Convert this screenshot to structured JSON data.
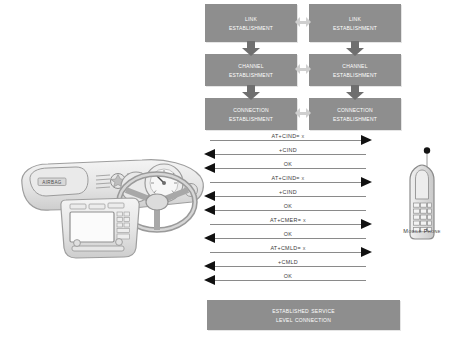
{
  "figure": {
    "background_color": "#ffffff",
    "box_fill": "#8e8e8e",
    "box_text_color": "#ffffff",
    "arrow_color": "#8a8a8a",
    "arrowhead_color": "#111111",
    "stack_arrow_color": "#6f6f6f",
    "interlink_arrow_color": "#cfcfcf"
  },
  "protocol_stack": {
    "left_column": [
      {
        "line1": "Link",
        "line2": "Establishment"
      },
      {
        "line1": "Channel",
        "line2": "Establishment"
      },
      {
        "line1": "Connection",
        "line2": "Establishment"
      }
    ],
    "right_column": [
      {
        "line1": "Link",
        "line2": "Establishment"
      },
      {
        "line1": "Channel",
        "line2": "Establishment"
      },
      {
        "line1": "Connection",
        "line2": "Establishment"
      }
    ]
  },
  "messages": [
    {
      "label": "AT+CIND= x",
      "direction": "right"
    },
    {
      "label": "+CIND",
      "direction": "left"
    },
    {
      "label": "OK",
      "direction": "left"
    },
    {
      "label": "AT+CIND= x",
      "direction": "right"
    },
    {
      "label": "+CIND",
      "direction": "left"
    },
    {
      "label": "OK",
      "direction": "left"
    },
    {
      "label": "AT+CMER= x",
      "direction": "right"
    },
    {
      "label": "OK",
      "direction": "left"
    },
    {
      "label": "AT+CMLD= x",
      "direction": "right"
    },
    {
      "label": "+CMLD",
      "direction": "left"
    },
    {
      "label": "OK",
      "direction": "left"
    }
  ],
  "established": {
    "line1": "Established Service",
    "line2": "Level Connection"
  },
  "mobile_phone": {
    "caption": "Mobile Phone"
  },
  "car_dashboard": {
    "airbag_label": "AIRBAG"
  }
}
